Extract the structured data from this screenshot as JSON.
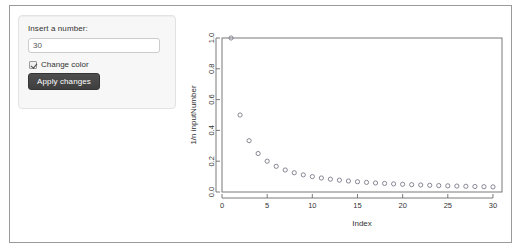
{
  "sidebar": {
    "number_label": "Insert a number:",
    "number_value": "30",
    "number_placeholder": "",
    "checkbox_label": "Change color",
    "checkbox_checked": true,
    "apply_label": "Apply changes"
  },
  "colors": {
    "panel_bg": "#f7f7f7",
    "panel_border": "#e3e3e3",
    "frame_border": "#9a9a9a",
    "button_bg": "#444444",
    "button_text": "#ffffff",
    "plot_axis": "#6b6b6b",
    "point_stroke": "#7a7a8a"
  },
  "chart_data": {
    "type": "scatter",
    "title": "",
    "xlabel": "Index",
    "ylabel": "1/n inputNumber",
    "xlim": [
      0,
      31
    ],
    "ylim": [
      0,
      1.0
    ],
    "xticks": [
      0,
      5,
      10,
      15,
      20,
      25,
      30
    ],
    "yticks": [
      0.0,
      0.2,
      0.4,
      0.6,
      0.8,
      1.0
    ],
    "xtick_labels": [
      "0",
      "5",
      "10",
      "15",
      "20",
      "25",
      "30"
    ],
    "ytick_labels": [
      "0.0",
      "0.2",
      "0.4",
      "0.6",
      "0.8",
      "1.0"
    ],
    "grid": false,
    "legend": null,
    "marker": "open-circle",
    "x": [
      1,
      2,
      3,
      4,
      5,
      6,
      7,
      8,
      9,
      10,
      11,
      12,
      13,
      14,
      15,
      16,
      17,
      18,
      19,
      20,
      21,
      22,
      23,
      24,
      25,
      26,
      27,
      28,
      29,
      30
    ],
    "y": [
      1,
      0.5,
      0.3333,
      0.25,
      0.2,
      0.1667,
      0.1429,
      0.125,
      0.1111,
      0.1,
      0.0909,
      0.0833,
      0.0769,
      0.0714,
      0.0667,
      0.0625,
      0.0588,
      0.0556,
      0.0526,
      0.05,
      0.0476,
      0.0455,
      0.0435,
      0.0417,
      0.04,
      0.0385,
      0.037,
      0.0357,
      0.0345,
      0.0333
    ]
  }
}
